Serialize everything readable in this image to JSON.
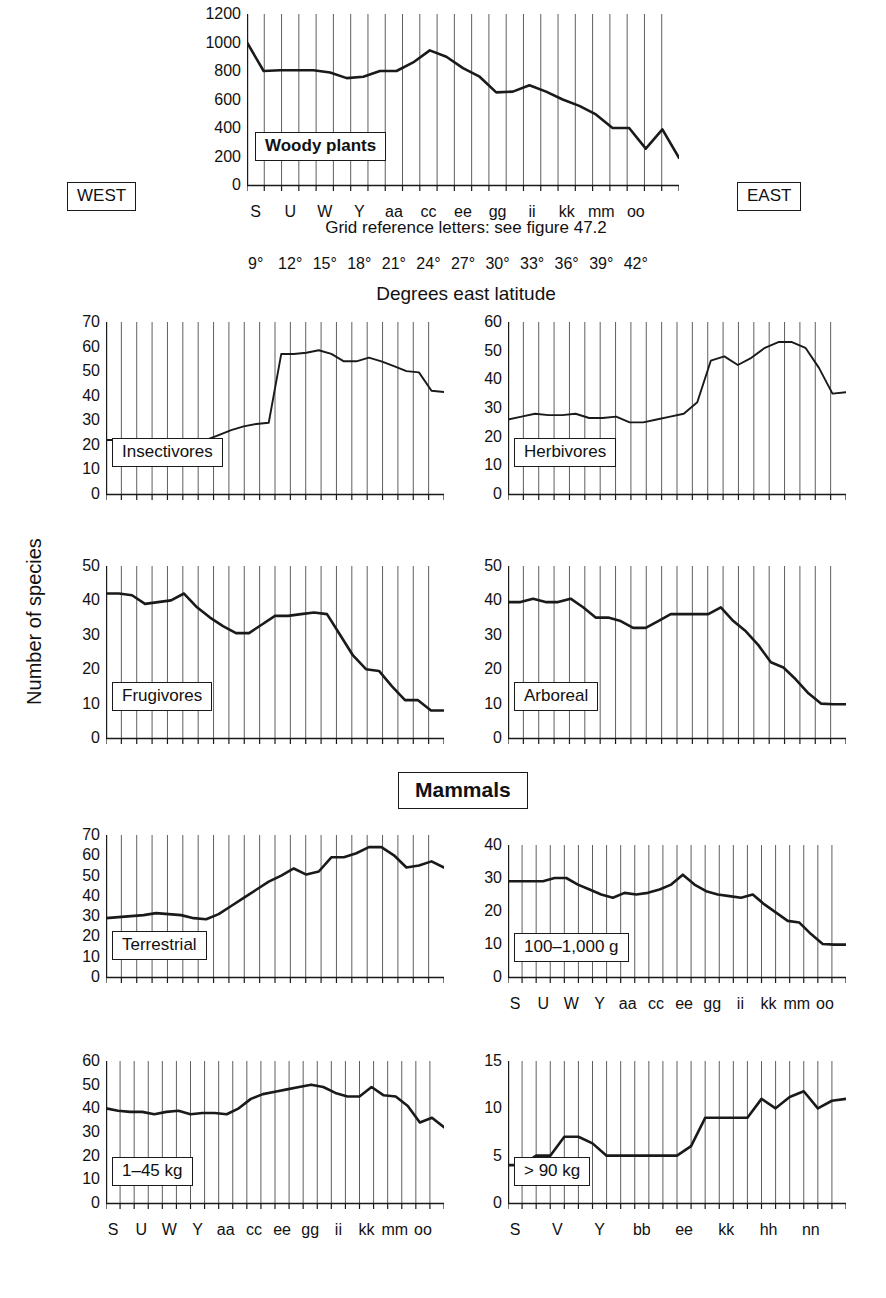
{
  "figure": {
    "global_y_axis_label": "Number of species",
    "mammals_header": "Mammals",
    "west_label": "WEST",
    "east_label": "EAST",
    "grid_reference_caption": "Grid reference letters: see figure 47.2",
    "degrees_caption": "Degrees east latitude",
    "degrees_ticks": [
      "9°",
      "12°",
      "15°",
      "18°",
      "21°",
      "24°",
      "27°",
      "30°",
      "33°",
      "36°",
      "39°",
      "42°"
    ],
    "line_color": "#1a1a1a",
    "grid_color": "#4d4d4d",
    "axis_color": "#1a1a1a",
    "background_color": "#ffffff"
  },
  "chart_data": [
    {
      "id": "woody-plants",
      "type": "line",
      "title": "Woody plants",
      "ylabel": "Number of species",
      "xlabel": "Grid reference letters: see figure 47.2",
      "ylim": [
        0,
        1200
      ],
      "yticks": [
        0,
        200,
        400,
        600,
        800,
        1000,
        1200
      ],
      "categories": [
        "S",
        "T",
        "U",
        "V",
        "W",
        "X",
        "Y",
        "Z",
        "aa",
        "bb",
        "cc",
        "dd",
        "ee",
        "ff",
        "gg",
        "hh",
        "ii",
        "jj",
        "kk",
        "ll",
        "mm",
        "nn",
        "oo",
        "pp",
        "qq"
      ],
      "xtick_labels": [
        "S",
        "U",
        "W",
        "Y",
        "aa",
        "cc",
        "ee",
        "gg",
        "ii",
        "kk",
        "mm",
        "oo"
      ],
      "values": [
        1000,
        800,
        805,
        805,
        805,
        790,
        750,
        760,
        800,
        800,
        860,
        945,
        900,
        820,
        760,
        650,
        655,
        700,
        655,
        600,
        555,
        495,
        400,
        400,
        255,
        390,
        190
      ],
      "grid": true
    },
    {
      "id": "insectivores",
      "type": "line",
      "title": "Insectivores",
      "ylim": [
        0,
        70
      ],
      "yticks": [
        0,
        10,
        20,
        30,
        40,
        50,
        60,
        70
      ],
      "values": [
        22,
        22,
        22,
        22,
        22,
        22,
        22,
        21.5,
        22,
        24,
        26,
        27.5,
        28.5,
        29,
        57,
        57,
        57.5,
        58.5,
        57,
        54,
        54,
        55.5,
        54,
        52,
        50,
        49.5,
        42,
        41.5
      ],
      "grid": true
    },
    {
      "id": "herbivores",
      "type": "line",
      "title": "Herbivores",
      "ylim": [
        0,
        60
      ],
      "yticks": [
        0,
        10,
        20,
        30,
        40,
        50,
        60
      ],
      "values": [
        26,
        27,
        28,
        27.5,
        27.5,
        28,
        26.5,
        26.5,
        27,
        25,
        25,
        26,
        27,
        28,
        32,
        46.5,
        48,
        45,
        47.5,
        51,
        53,
        53,
        51,
        44,
        35,
        35.5
      ],
      "grid": true
    },
    {
      "id": "frugivores",
      "type": "line",
      "title": "Frugivores",
      "ylim": [
        0,
        50
      ],
      "yticks": [
        0,
        10,
        20,
        30,
        40,
        50
      ],
      "values": [
        42,
        42,
        41.5,
        39,
        39.5,
        40,
        42,
        38,
        35,
        32.5,
        30.5,
        30.5,
        33,
        35.5,
        35.5,
        36,
        36.5,
        36,
        30,
        24,
        20,
        19.5,
        15,
        11,
        11,
        8,
        8
      ],
      "grid": true
    },
    {
      "id": "arboreal",
      "type": "line",
      "title": "Arboreal",
      "ylim": [
        0,
        50
      ],
      "yticks": [
        0,
        10,
        20,
        30,
        40,
        50
      ],
      "values": [
        39.5,
        39.5,
        40.5,
        39.5,
        39.5,
        40.5,
        38,
        35,
        35,
        34,
        32,
        32,
        34,
        36,
        36,
        36,
        36,
        38,
        34,
        31,
        27,
        22,
        20.5,
        17,
        13,
        10,
        9.8,
        9.8
      ],
      "grid": true
    },
    {
      "id": "terrestrial",
      "type": "line",
      "title": "Terrestrial",
      "ylim": [
        0,
        70
      ],
      "yticks": [
        0,
        10,
        20,
        30,
        40,
        50,
        60,
        70
      ],
      "values": [
        29,
        29.5,
        30,
        30.5,
        31.5,
        31,
        30.5,
        29,
        28.5,
        31,
        35,
        39,
        43,
        47,
        50,
        53.5,
        50.5,
        52,
        59,
        59,
        61,
        64,
        64,
        60,
        54,
        55,
        57,
        54
      ],
      "grid": true
    },
    {
      "id": "mass-100-1000g",
      "type": "line",
      "title": "100–1,000 g",
      "ylim": [
        0,
        40
      ],
      "yticks": [
        0,
        10,
        20,
        30,
        40
      ],
      "xtick_labels": [
        "S",
        "U",
        "W",
        "Y",
        "aa",
        "cc",
        "ee",
        "gg",
        "ii",
        "kk",
        "mm",
        "oo"
      ],
      "values": [
        29,
        29,
        29,
        29,
        30,
        30,
        28,
        26.5,
        25,
        24,
        25.5,
        25,
        25.5,
        26.5,
        28,
        31,
        28,
        26,
        25,
        24.5,
        24,
        25,
        22,
        19.5,
        17,
        16.5,
        13,
        10,
        9.8,
        9.8
      ],
      "grid": true
    },
    {
      "id": "mass-1-45kg",
      "type": "line",
      "title": "1–45 kg",
      "ylim": [
        0,
        60
      ],
      "yticks": [
        0,
        10,
        20,
        30,
        40,
        50,
        60
      ],
      "xtick_labels": [
        "S",
        "U",
        "W",
        "Y",
        "aa",
        "cc",
        "ee",
        "gg",
        "ii",
        "kk",
        "mm",
        "oo"
      ],
      "values": [
        40,
        39,
        38.5,
        38.5,
        37.5,
        38.5,
        39,
        37.5,
        38,
        38,
        37.5,
        40,
        44,
        46,
        47,
        48,
        49,
        50,
        49,
        46.5,
        45,
        45,
        49,
        45.5,
        45,
        41,
        34,
        36,
        32
      ],
      "grid": true
    },
    {
      "id": "mass-over-90kg",
      "type": "line",
      "title": "> 90 kg",
      "ylim": [
        0,
        15
      ],
      "yticks": [
        0,
        5,
        10,
        15
      ],
      "xtick_labels": [
        "S",
        "V",
        "Y",
        "bb",
        "ee",
        "kk",
        "hh",
        "nn"
      ],
      "values": [
        4,
        4,
        5,
        5,
        7,
        7,
        6.3,
        5,
        5,
        5,
        5,
        5,
        5,
        6,
        9,
        9,
        9,
        9,
        11,
        10,
        11.2,
        11.8,
        10,
        10.8,
        11
      ],
      "grid": true
    }
  ]
}
